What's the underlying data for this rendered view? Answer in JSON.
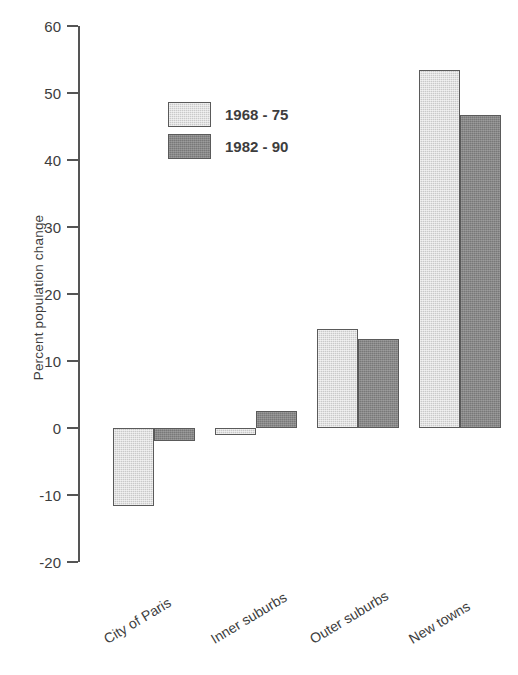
{
  "chart_data": {
    "type": "bar",
    "title": "",
    "xlabel": "",
    "ylabel": "Percent population change",
    "categories": [
      "City of Paris",
      "Inner suburbs",
      "Outer suburbs",
      "New towns"
    ],
    "series": [
      {
        "name": "1968 - 75",
        "color": "#c9c9c9",
        "values": [
          -11.7,
          -1.0,
          14.8,
          53.4
        ]
      },
      {
        "name": "1982 - 90",
        "color": "#787878",
        "values": [
          -2.0,
          2.5,
          13.3,
          46.7
        ]
      }
    ],
    "ylim": [
      -20,
      60
    ],
    "yticks": [
      60,
      50,
      40,
      30,
      20,
      10,
      0,
      -10,
      -20
    ],
    "ytick_labels": [
      "60",
      "50",
      "40",
      "30",
      "20",
      "10",
      "0",
      "-10",
      "-20"
    ],
    "grid": false,
    "legend_position": "upper-left-inside",
    "zero_line": true,
    "xtick_label_rotation": -31
  }
}
